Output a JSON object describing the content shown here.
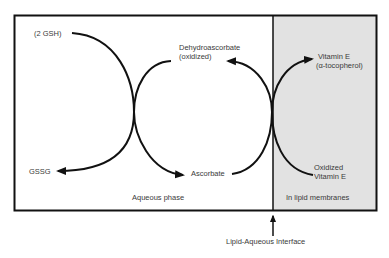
{
  "diagram": {
    "colors": {
      "lipid_region": "#e2e2e2",
      "aqueous_region": "#ffffff",
      "stroke": "#111111",
      "text": "#3a3a3a"
    },
    "regions": {
      "aqueous": "Aqueous phase",
      "lipid": "In lipid membranes"
    },
    "cycles": {
      "glutathione": {
        "reduced": "(2 GSH)",
        "oxidized": "GSSG"
      },
      "ascorbate": {
        "oxidized_line1": "Dehydroascorbate",
        "oxidized_line2": "(oxidized)",
        "reduced": "Ascorbate"
      },
      "vitamin_e": {
        "reduced_line1": "Vitamin E",
        "reduced_line2": "(α-tocopherol)",
        "oxidized_line1": "Oxidized",
        "oxidized_line2": "Vitamin E"
      }
    },
    "interface_label": "Lipid-Aqueous Interface"
  }
}
